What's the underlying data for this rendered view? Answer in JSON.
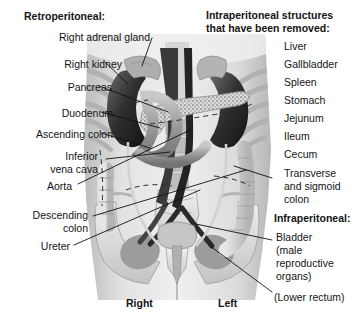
{
  "figure": {
    "orientation_labels": {
      "right": "Right",
      "left": "Left"
    }
  },
  "left_column": {
    "heading": "Retroperitoneal:",
    "labels": [
      {
        "text": "Right adrenal gland",
        "lines": [
          "Right adrenal gland"
        ]
      },
      {
        "text": "Right kidney",
        "lines": [
          "Right kidney"
        ]
      },
      {
        "text": "Pancreas",
        "lines": [
          "Pancreas"
        ]
      },
      {
        "text": "Duodenum",
        "lines": [
          "Duodenum"
        ]
      },
      {
        "text": "Ascending colon",
        "lines": [
          "Ascending colon"
        ]
      },
      {
        "text": "Inferior vena cava",
        "lines": [
          "Inferior",
          "vena cava"
        ]
      },
      {
        "text": "Aorta",
        "lines": [
          "Aorta"
        ]
      },
      {
        "text": "Descending colon",
        "lines": [
          "Descending",
          "colon"
        ]
      },
      {
        "text": "Ureter",
        "lines": [
          "Ureter"
        ]
      }
    ]
  },
  "right_column": {
    "heading_lines": [
      "Intraperitoneal structures",
      "that have been removed:"
    ],
    "removed_structures": [
      {
        "lines": [
          "Liver"
        ]
      },
      {
        "lines": [
          "Gallbladder"
        ]
      },
      {
        "lines": [
          "Spleen"
        ]
      },
      {
        "lines": [
          "Stomach"
        ]
      },
      {
        "lines": [
          "Jejunum"
        ]
      },
      {
        "lines": [
          "Ileum"
        ]
      },
      {
        "lines": [
          "Cecum"
        ]
      },
      {
        "lines": [
          "Transverse",
          "and sigmoid",
          "colon"
        ]
      }
    ],
    "infra_heading": "Infraperitoneal:",
    "infra_items": [
      {
        "lines": [
          "Bladder",
          "(male",
          "reproductive",
          "organs)"
        ]
      }
    ],
    "lower_rectum": "(Lower rectum)"
  },
  "colors": {
    "text": "#141414",
    "leader": "#111111",
    "background": "#ffffff",
    "illustration_light": "#d9d9d9",
    "illustration_mid": "#a8a8a8",
    "illustration_dark": "#4a4a4a",
    "illustration_darkest": "#1d1d1d"
  }
}
